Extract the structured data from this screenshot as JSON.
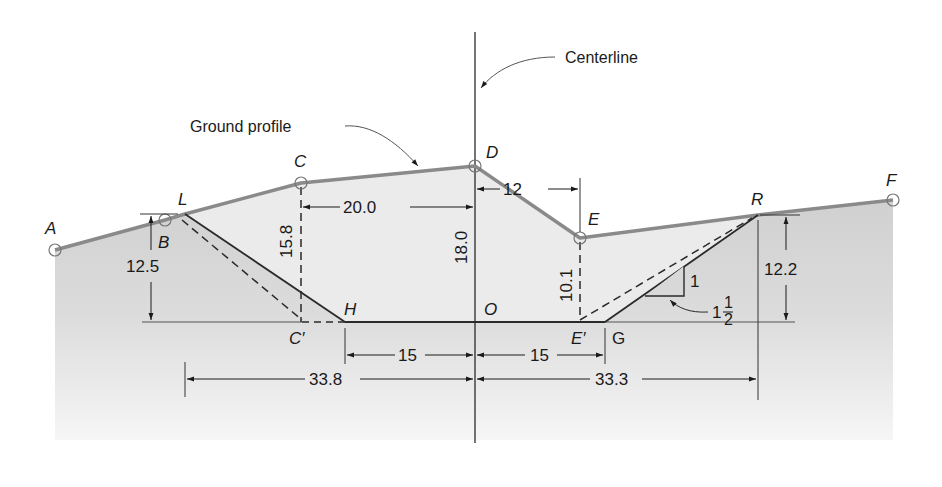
{
  "figure": {
    "type": "highway cross-section (cut section)",
    "annotations": {
      "centerline": "Centerline",
      "ground_profile": "Ground profile"
    },
    "points": {
      "A": "A",
      "B": "B",
      "C": "C",
      "D": "D",
      "E": "E",
      "F": "F",
      "L": "L",
      "R": "R",
      "H": "H",
      "G": "G",
      "O": "O",
      "C_prime": "C′",
      "E_prime": "E′"
    },
    "dimensions": {
      "left_cut_height": "12.5",
      "C_height": "15.8",
      "C_to_centerline": "20.0",
      "D_height": "18.0",
      "D_to_E": "12",
      "E_height": "10.1",
      "right_cut_height": "12.2",
      "H_to_centerline": "15",
      "centerline_to_G": "15",
      "L_to_centerline": "33.8",
      "centerline_to_R": "33.3"
    },
    "slope": {
      "rise": "1",
      "run_whole": "1",
      "run_num": "1",
      "run_den": "2"
    },
    "colors": {
      "ground_line": "#8a8a8a",
      "cut_fill": "#e6e6e6",
      "ground_fill_top": "#cfcfcf",
      "ground_fill_bottom": "#f4f4f4",
      "line": "#2a2a2a"
    }
  }
}
